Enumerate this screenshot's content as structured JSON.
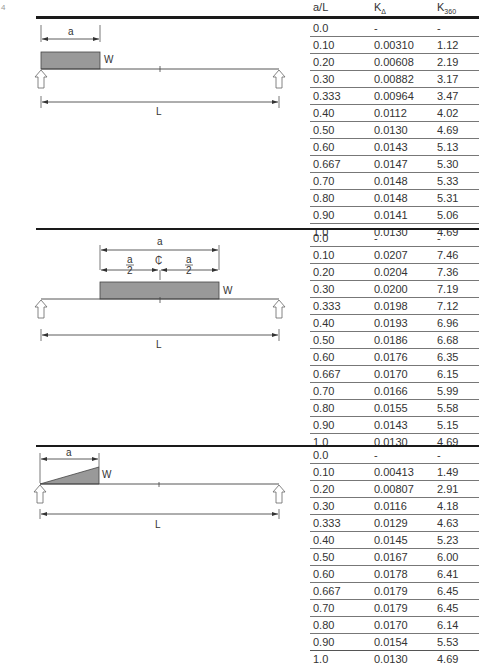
{
  "corner_mark": "4",
  "columns": {
    "ratio": "a/L",
    "k_delta": "K",
    "k_delta_sub": "Δ",
    "k360": "K",
    "k360_sub": "360"
  },
  "sections": [
    {
      "diagram": {
        "type": "partial-uniform-load-at-support",
        "labels": {
          "a": "a",
          "w": "W",
          "l": "L"
        }
      },
      "rows": [
        [
          "0.0",
          "-",
          "-"
        ],
        [
          "0.10",
          "0.00310",
          "1.12"
        ],
        [
          "0.20",
          "0.00608",
          "2.19"
        ],
        [
          "0.30",
          "0.00882",
          "3.17"
        ],
        [
          "0.333",
          "0.00964",
          "3.47"
        ],
        [
          "0.40",
          "0.0112",
          "4.02"
        ],
        [
          "0.50",
          "0.0130",
          "4.69"
        ],
        [
          "0.60",
          "0.0143",
          "5.13"
        ],
        [
          "0.667",
          "0.0147",
          "5.30"
        ],
        [
          "0.70",
          "0.0148",
          "5.33"
        ],
        [
          "0.80",
          "0.0148",
          "5.31"
        ],
        [
          "0.90",
          "0.0141",
          "5.06"
        ],
        [
          "1.0",
          "0.0130",
          "4.69"
        ]
      ]
    },
    {
      "diagram": {
        "type": "centered-uniform-load",
        "labels": {
          "a": "a",
          "half_num": "a",
          "half_den": "2",
          "centerline": "₵",
          "w": "W",
          "l": "L"
        }
      },
      "rows": [
        [
          "0.0",
          "-",
          "-"
        ],
        [
          "0.10",
          "0.0207",
          "7.46"
        ],
        [
          "0.20",
          "0.0204",
          "7.36"
        ],
        [
          "0.30",
          "0.0200",
          "7.19"
        ],
        [
          "0.333",
          "0.0198",
          "7.12"
        ],
        [
          "0.40",
          "0.0193",
          "6.96"
        ],
        [
          "0.50",
          "0.0186",
          "6.68"
        ],
        [
          "0.60",
          "0.0176",
          "6.35"
        ],
        [
          "0.667",
          "0.0170",
          "6.15"
        ],
        [
          "0.70",
          "0.0166",
          "5.99"
        ],
        [
          "0.80",
          "0.0155",
          "5.58"
        ],
        [
          "0.90",
          "0.0143",
          "5.15"
        ],
        [
          "1.0",
          "0.0130",
          "4.69"
        ]
      ]
    },
    {
      "diagram": {
        "type": "triangular-load-from-support",
        "labels": {
          "a": "a",
          "w": "W",
          "l": "L"
        }
      },
      "rows": [
        [
          "0.0",
          "-",
          "-"
        ],
        [
          "0.10",
          "0.00413",
          "1.49"
        ],
        [
          "0.20",
          "0.00807",
          "2.91"
        ],
        [
          "0.30",
          "0.0116",
          "4.18"
        ],
        [
          "0.333",
          "0.0129",
          "4.63"
        ],
        [
          "0.40",
          "0.0145",
          "5.23"
        ],
        [
          "0.50",
          "0.0167",
          "6.00"
        ],
        [
          "0.60",
          "0.0178",
          "6.41"
        ],
        [
          "0.667",
          "0.0179",
          "6.45"
        ],
        [
          "0.70",
          "0.0179",
          "6.45"
        ],
        [
          "0.80",
          "0.0170",
          "6.14"
        ],
        [
          "0.90",
          "0.0154",
          "5.53"
        ],
        [
          "1.0",
          "0.0130",
          "4.69"
        ]
      ]
    }
  ]
}
